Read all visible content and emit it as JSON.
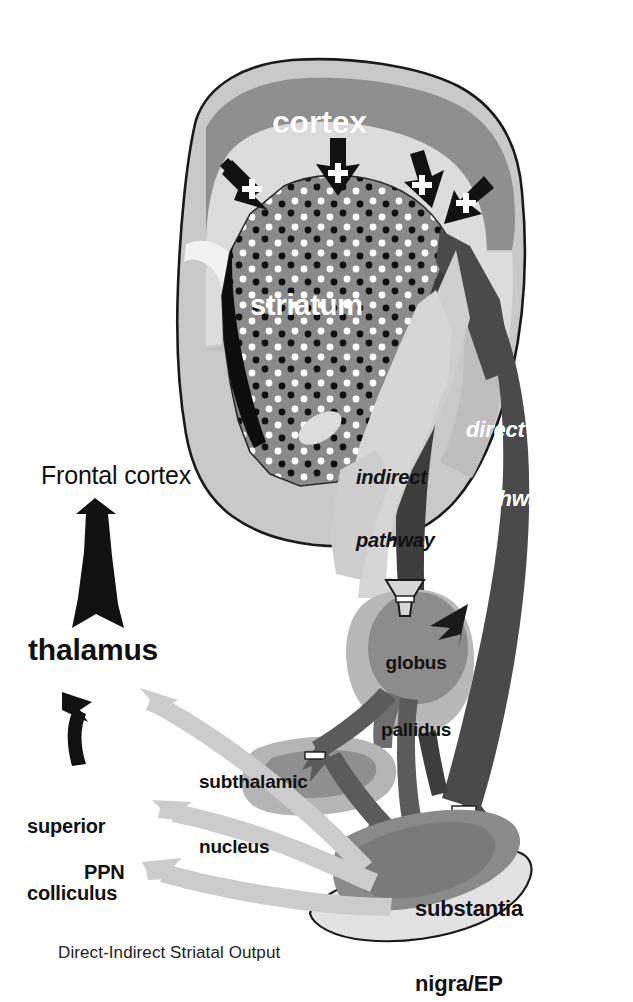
{
  "figure": {
    "caption": "Direct-Indirect Striatal Output",
    "width": 633,
    "height": 1002,
    "background": "#ffffff"
  },
  "labels": {
    "cortex": "cortex",
    "striatum": "striatum",
    "direct_pathway_line1": "direct",
    "direct_pathway_line2": "pathway",
    "indirect_pathway_line1": "indirect",
    "indirect_pathway_line2": "pathway",
    "frontal_cortex": "Frontal cortex",
    "thalamus": "thalamus",
    "superior_colliculus_line1": "superior",
    "superior_colliculus_line2": "colliculus",
    "ppn": "PPN",
    "globus_pallidus_line1": "globus",
    "globus_pallidus_line2": "pallidus",
    "subthalamic_nucleus_line1": "subthalamic",
    "subthalamic_nucleus_line2": "nucleus",
    "substantia_nigra_line1": "substantia",
    "substantia_nigra_line2": "nigra/EP"
  },
  "signs": {
    "excitatory": "+",
    "inhibitory": "−"
  },
  "connections": [
    {
      "id": "cortex-to-striatum-1",
      "from": "cortex",
      "to": "striatum",
      "sign": "+",
      "style": "black-arrow"
    },
    {
      "id": "cortex-to-striatum-2",
      "from": "cortex",
      "to": "striatum",
      "sign": "+",
      "style": "black-arrow"
    },
    {
      "id": "cortex-to-striatum-3",
      "from": "cortex",
      "to": "striatum",
      "sign": "+",
      "style": "black-arrow"
    },
    {
      "id": "cortex-to-striatum-4",
      "from": "cortex",
      "to": "striatum",
      "sign": "+",
      "style": "black-arrow"
    },
    {
      "id": "indirect-striatum-to-gp",
      "from": "striatum",
      "to": "globus pallidus",
      "sign": "−",
      "style": "light-outline-arrow"
    },
    {
      "id": "direct-striatum-to-sn",
      "from": "striatum",
      "to": "substantia nigra/EP",
      "sign": "−",
      "style": "dark-band"
    },
    {
      "id": "gp-to-stn",
      "from": "globus pallidus",
      "to": "subthalamic nucleus",
      "sign": "−",
      "style": "dark-arrow"
    },
    {
      "id": "gp-to-sn",
      "from": "globus pallidus",
      "to": "substantia nigra/EP",
      "sign": "−",
      "style": "dark-arrow"
    },
    {
      "id": "stn-to-sn",
      "from": "subthalamic nucleus",
      "to": "substantia nigra/EP",
      "sign": "+",
      "style": "dark-arrow"
    },
    {
      "id": "sn-to-thalamus",
      "from": "substantia nigra/EP",
      "to": "thalamus",
      "sign": "",
      "style": "light-gray-arrow"
    },
    {
      "id": "sn-to-superior-colliculus",
      "from": "substantia nigra/EP",
      "to": "superior colliculus",
      "sign": "",
      "style": "light-gray-arrow"
    },
    {
      "id": "sn-to-ppn",
      "from": "substantia nigra/EP",
      "to": "PPN",
      "sign": "",
      "style": "light-gray-arrow"
    },
    {
      "id": "thalamus-to-frontal-cortex",
      "from": "thalamus",
      "to": "Frontal cortex",
      "sign": "",
      "style": "black-tapered-arrow"
    },
    {
      "id": "superior-colliculus-to-thalamus",
      "from": "superior colliculus",
      "to": "thalamus",
      "sign": "",
      "style": "black-curved-arrow"
    }
  ],
  "colors": {
    "background": "#ffffff",
    "brain_outline": "#1a1a1a",
    "brain_fill": "#c9c9c9",
    "cortex_band": "#8f8f8f",
    "cortex_band_light": "#dcdcdc",
    "striatum": "#8a8a8a",
    "striatum_dot_dark": "#101010",
    "striatum_dot_light": "#ffffff",
    "ventricle": "#0d0d0d",
    "globus_pallidus": "#8c8c8c",
    "globus_pallidus_halo": "#b8b8b8",
    "subthalamic_nucleus": "#b5b5b5",
    "substantia_nigra": "#8a8a8a",
    "direct_pathway": "#4a4a4a",
    "indirect_pathway": "#cfcfcf",
    "dark_arrow": "#5b5b5b",
    "light_gray_arrow": "#cccccc",
    "text_dark": "#111111",
    "text_light": "#ffffff"
  }
}
